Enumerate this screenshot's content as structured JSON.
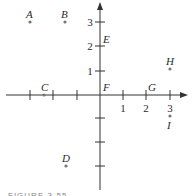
{
  "figure": {
    "caption": "FIGURE 3-55",
    "axes": {
      "x_ticks": [
        -4,
        -3,
        -2,
        -1,
        1,
        2,
        3
      ],
      "y_ticks": [
        -3,
        -2,
        -1,
        1,
        2,
        3
      ],
      "x_tick_labels": [
        "1",
        "2",
        "3"
      ],
      "y_tick_labels": [
        "1",
        "2",
        "3"
      ]
    },
    "points": [
      {
        "label": "A",
        "x": -3,
        "y": 3,
        "marker": true
      },
      {
        "label": "B",
        "x": -1.5,
        "y": 3,
        "marker": true
      },
      {
        "label": "C",
        "x": -2.5,
        "y": 0,
        "marker": true
      },
      {
        "label": "D",
        "x": -1.5,
        "y": -3,
        "marker": true
      },
      {
        "label": "E",
        "x": 0,
        "y": 2,
        "marker": false
      },
      {
        "label": "F",
        "x": 0,
        "y": 0,
        "marker": false
      },
      {
        "label": "G",
        "x": 2,
        "y": 0,
        "marker": false
      },
      {
        "label": "H",
        "x": 3,
        "y": 1,
        "marker": true
      },
      {
        "label": "I",
        "x": 3,
        "y": -0.5,
        "marker": true
      }
    ]
  }
}
